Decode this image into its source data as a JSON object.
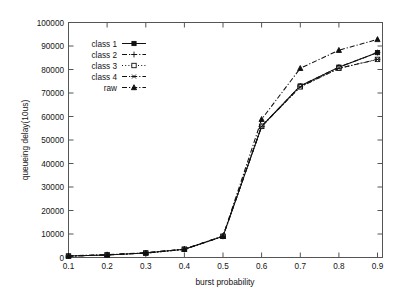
{
  "chart_data": {
    "type": "line",
    "title": "",
    "xlabel": "burst probability",
    "ylabel": "queueing delay(10us)",
    "xlim": [
      0.1,
      0.9
    ],
    "ylim": [
      0,
      100000
    ],
    "grid": false,
    "legend_position": "top-left",
    "x": [
      0.1,
      0.2,
      0.3,
      0.4,
      0.5,
      0.6,
      0.7,
      0.8,
      0.9
    ],
    "xticklabels": [
      "0.1",
      "0.2",
      "0.3",
      "0.4",
      "0.5",
      "0.6",
      "0.7",
      "0.8",
      "0.9"
    ],
    "yticklabels": [
      "0",
      "10000",
      "20000",
      "30000",
      "40000",
      "50000",
      "60000",
      "70000",
      "80000",
      "90000",
      "100000"
    ],
    "yticks": [
      0,
      10000,
      20000,
      30000,
      40000,
      50000,
      60000,
      70000,
      80000,
      90000,
      100000
    ],
    "series": [
      {
        "name": "class 1",
        "marker": "filled-square",
        "linestyle": "solid",
        "values": [
          600,
          1100,
          1900,
          3500,
          9000,
          55800,
          73000,
          81000,
          87200
        ]
      },
      {
        "name": "class 2",
        "marker": "plus",
        "linestyle": "dash-dot",
        "values": [
          600,
          1100,
          1900,
          3500,
          9000,
          55800,
          73000,
          81000,
          87200
        ]
      },
      {
        "name": "class 3",
        "marker": "open-square",
        "linestyle": "dotted",
        "values": [
          600,
          1100,
          1900,
          3500,
          9000,
          55800,
          72600,
          80500,
          84300
        ]
      },
      {
        "name": "class 4",
        "marker": "star",
        "linestyle": "dash-dot",
        "values": [
          600,
          1100,
          1900,
          3500,
          9000,
          55800,
          72600,
          80500,
          84300
        ]
      },
      {
        "name": "raw",
        "marker": "triangle",
        "linestyle": "dash-dot",
        "values": [
          700,
          1200,
          2000,
          3600,
          9100,
          58800,
          80500,
          88200,
          92800
        ]
      }
    ]
  },
  "legend": {
    "entries": [
      {
        "label": "class 1"
      },
      {
        "label": "class 2"
      },
      {
        "label": "class 3"
      },
      {
        "label": "class 4"
      },
      {
        "label": "raw"
      }
    ]
  },
  "colors": {
    "ink": "#101010",
    "frame": "#555555",
    "background": "#ffffff"
  }
}
